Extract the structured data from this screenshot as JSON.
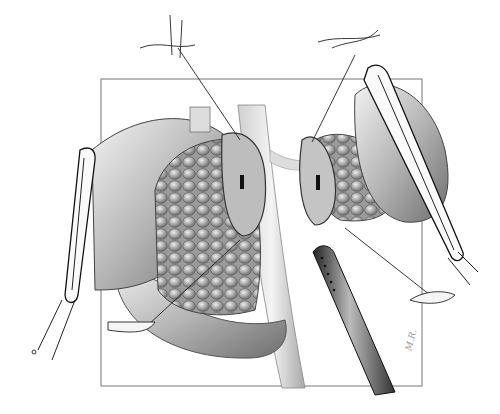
{
  "image": {
    "subject": "surgical illustration: transected pancreas with stapled/clamped ends, bowel clamps, stay sutures and drain",
    "style": "grayscale pencil medical illustration",
    "colors": {
      "background": "#ffffff",
      "ink": "#222222",
      "shade": "#8a8a8a",
      "light": "#d9d9d9"
    },
    "frame": {
      "x": 101,
      "y": 79,
      "width": 321,
      "height": 307
    },
    "artist_signature": "illegible"
  }
}
